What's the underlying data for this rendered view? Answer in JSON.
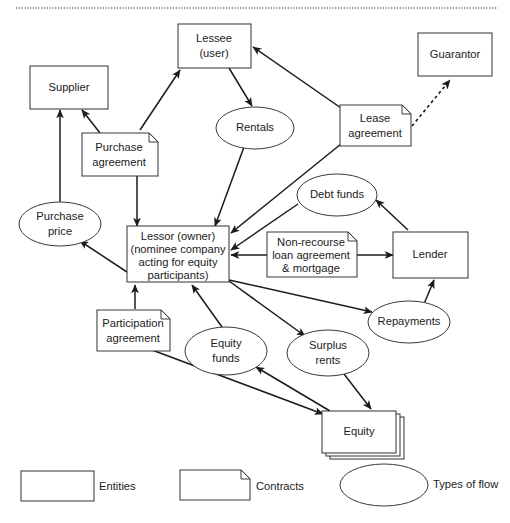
{
  "diagram": {
    "top_rule": "dotted-divider",
    "colors": {
      "stroke": "#3a3a3a",
      "edge": "#1b1b1b",
      "text": "#1b1b1b",
      "background": "#ffffff",
      "rule": "#6e6e6e"
    },
    "nodes": [
      {
        "id": "supplier",
        "kind": "entity",
        "label": "Supplier",
        "lines": [
          "Supplier"
        ]
      },
      {
        "id": "lessee",
        "kind": "entity",
        "label": "Lessee (user)",
        "lines": [
          "Lessee",
          "(user)"
        ]
      },
      {
        "id": "guarantor",
        "kind": "entity",
        "label": "Guarantor",
        "lines": [
          "Guarantor"
        ]
      },
      {
        "id": "lender",
        "kind": "entity",
        "label": "Lender",
        "lines": [
          "Lender"
        ]
      },
      {
        "id": "lessor",
        "kind": "entity",
        "label": "Lessor (owner) (nominee company acting for equity participants)",
        "lines": [
          "Lessor (owner)",
          "(nominee company",
          "acting for equity",
          "participants)"
        ]
      },
      {
        "id": "equity",
        "kind": "entity-stack",
        "label": "Equity",
        "lines": [
          "Equity"
        ]
      },
      {
        "id": "purchase_agreement",
        "kind": "contract",
        "label": "Purchase agreement",
        "lines": [
          "Purchase",
          "agreement"
        ]
      },
      {
        "id": "lease_agreement",
        "kind": "contract",
        "label": "Lease agreement",
        "lines": [
          "Lease",
          "agreement"
        ]
      },
      {
        "id": "nonrecourse_loan",
        "kind": "contract",
        "label": "Non-recourse loan agreement & mortgage",
        "lines": [
          "Non-recourse",
          "loan agreement",
          "& mortgage"
        ]
      },
      {
        "id": "participation_agreement",
        "kind": "contract",
        "label": "Participation agreement",
        "lines": [
          "Participation",
          "agreement"
        ]
      },
      {
        "id": "purchase_price",
        "kind": "flow",
        "label": "Purchase price",
        "lines": [
          "Purchase",
          "price"
        ]
      },
      {
        "id": "rentals",
        "kind": "flow",
        "label": "Rentals",
        "lines": [
          "Rentals"
        ]
      },
      {
        "id": "debt_funds",
        "kind": "flow",
        "label": "Debt funds",
        "lines": [
          "Debt funds"
        ]
      },
      {
        "id": "repayments",
        "kind": "flow",
        "label": "Repayments",
        "lines": [
          "Repayments"
        ]
      },
      {
        "id": "equity_funds",
        "kind": "flow",
        "label": "Equity funds",
        "lines": [
          "Equity",
          "funds"
        ]
      },
      {
        "id": "surplus_rents",
        "kind": "flow",
        "label": "Surplus rents",
        "lines": [
          "Surplus",
          "rents"
        ]
      }
    ],
    "edges": [
      {
        "from": "purchase_price",
        "to": "supplier",
        "style": "solid"
      },
      {
        "from": "purchase_agreement",
        "to": "supplier",
        "style": "solid"
      },
      {
        "from": "purchase_agreement",
        "to": "lessee",
        "style": "solid"
      },
      {
        "from": "purchase_agreement",
        "to": "lessor",
        "style": "solid"
      },
      {
        "from": "lessee",
        "to": "rentals",
        "style": "solid"
      },
      {
        "from": "rentals",
        "to": "lessor",
        "style": "solid"
      },
      {
        "from": "lease_agreement",
        "to": "lessee",
        "style": "solid"
      },
      {
        "from": "lease_agreement",
        "to": "lessor",
        "style": "solid"
      },
      {
        "from": "lease_agreement",
        "to": "guarantor",
        "style": "dashed"
      },
      {
        "from": "debt_funds",
        "to": "lessor",
        "style": "solid"
      },
      {
        "from": "lender",
        "to": "debt_funds",
        "style": "solid"
      },
      {
        "from": "nonrecourse_loan",
        "to": "lessor",
        "style": "solid"
      },
      {
        "from": "nonrecourse_loan",
        "to": "lender",
        "style": "solid"
      },
      {
        "from": "lessor",
        "to": "repayments",
        "style": "solid"
      },
      {
        "from": "repayments",
        "to": "lender",
        "style": "solid"
      },
      {
        "from": "lessor",
        "to": "purchase_price",
        "style": "solid"
      },
      {
        "from": "lessor",
        "to": "surplus_rents",
        "style": "solid"
      },
      {
        "from": "participation_agreement",
        "to": "lessor",
        "style": "solid"
      },
      {
        "from": "equity_funds",
        "to": "lessor",
        "style": "solid"
      },
      {
        "from": "participation_agreement",
        "to": "equity",
        "style": "solid"
      },
      {
        "from": "equity",
        "to": "equity_funds",
        "style": "solid"
      },
      {
        "from": "surplus_rents",
        "to": "equity",
        "style": "solid"
      }
    ],
    "legend": [
      {
        "id": "legend-entities",
        "shape": "rectangle",
        "label": "Entities"
      },
      {
        "id": "legend-contracts",
        "shape": "folded-corner",
        "label": "Contracts"
      },
      {
        "id": "legend-flows",
        "shape": "ellipse",
        "label": "Types of flow"
      }
    ]
  }
}
